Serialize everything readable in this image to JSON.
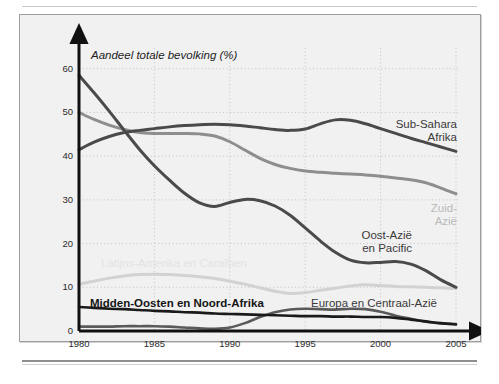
{
  "figure": {
    "top_cut_text": "",
    "background_color": "#f1f1f1",
    "border_color": "#9e9e9e"
  },
  "chart_data": {
    "type": "line",
    "title": "",
    "axis_title": "Aandeel totale bevolking (%)",
    "xlabel": "",
    "ylabel": "Aandeel totale bevolking (%)",
    "xlim": [
      1980,
      2005
    ],
    "ylim": [
      0,
      62
    ],
    "ytick_labels": [
      "0",
      "10",
      "20",
      "30",
      "40",
      "50",
      "60"
    ],
    "ytick_values": [
      0,
      10,
      20,
      30,
      40,
      50,
      60
    ],
    "xtick_labels": [
      "1980",
      "1985",
      "1990",
      "1995",
      "2000",
      "2005"
    ],
    "xtick_values": [
      1980,
      1985,
      1990,
      1995,
      2000,
      2005
    ],
    "grid": true,
    "legend": "inline-labels",
    "x": [
      1980,
      1981,
      1982,
      1983,
      1984,
      1985,
      1986,
      1987,
      1988,
      1989,
      1990,
      1991,
      1992,
      1993,
      1994,
      1995,
      1996,
      1997,
      1998,
      1999,
      2000,
      2001,
      2002,
      2003,
      2004,
      2005
    ],
    "series": [
      {
        "name": "Sub-Sahara Afrika",
        "label": "Sub-Sahara\nAfrika",
        "color": "#4a4a4a",
        "width": 3.0,
        "values": [
          41.5,
          43.2,
          44.5,
          45.4,
          45.9,
          46.3,
          46.7,
          47.0,
          47.2,
          47.3,
          47.2,
          46.9,
          46.5,
          46.1,
          45.9,
          46.2,
          47.4,
          48.3,
          48.2,
          47.4,
          46.3,
          45.2,
          44.1,
          43.1,
          42.1,
          41.1
        ]
      },
      {
        "name": "Zuid-Azië",
        "label": "Zuid-\nAzië",
        "color": "#8e8e8e",
        "width": 3.0,
        "values": [
          50.0,
          48.4,
          47.1,
          46.1,
          45.4,
          45.2,
          45.2,
          45.2,
          45.1,
          44.6,
          43.3,
          41.4,
          39.5,
          38.1,
          37.2,
          36.6,
          36.3,
          36.1,
          35.9,
          35.7,
          35.4,
          35.0,
          34.6,
          33.9,
          32.7,
          31.4
        ]
      },
      {
        "name": "Oost-Azië en Pacific",
        "label": "Oost-Azië\nen Pacific",
        "color": "#4a4a4a",
        "width": 3.0,
        "values": [
          58.5,
          54.5,
          50.3,
          45.9,
          41.6,
          37.8,
          34.5,
          31.5,
          29.3,
          28.5,
          29.4,
          30.1,
          29.8,
          28.6,
          26.5,
          23.6,
          20.6,
          18.0,
          16.2,
          15.6,
          15.7,
          15.9,
          15.3,
          13.8,
          11.7,
          10.0
        ]
      },
      {
        "name": "Latijns-Amerika en Caraïben",
        "label": "Latijns-Amerika en Caraïben",
        "color": "#d2d2d2",
        "width": 3.0,
        "values": [
          10.7,
          11.4,
          12.1,
          12.6,
          12.9,
          13.0,
          12.9,
          12.7,
          12.4,
          12.0,
          11.4,
          10.7,
          9.9,
          9.1,
          8.6,
          8.8,
          9.3,
          9.8,
          10.3,
          10.6,
          10.4,
          10.2,
          10.1,
          10.0,
          9.9,
          9.7
        ]
      },
      {
        "name": "Midden-Oosten en Noord-Afrika",
        "label": "Midden-Oosten en Noord-Afrika",
        "color": "#1a1a1a",
        "width": 2.6,
        "values": [
          5.5,
          5.3,
          5.1,
          5.0,
          4.8,
          4.6,
          4.5,
          4.3,
          4.2,
          4.0,
          3.9,
          3.8,
          3.7,
          3.6,
          3.5,
          3.4,
          3.4,
          3.3,
          3.3,
          3.2,
          3.2,
          3.0,
          2.6,
          2.2,
          1.8,
          1.5
        ]
      },
      {
        "name": "Europa en Centraal-Azië",
        "label": "Europa en Centraal-Azië",
        "color": "#5a5a5a",
        "width": 2.6,
        "values": [
          1.0,
          1.0,
          1.0,
          1.1,
          1.1,
          1.1,
          1.0,
          0.8,
          0.6,
          0.5,
          0.8,
          1.8,
          3.2,
          4.3,
          4.9,
          5.1,
          5.0,
          4.9,
          5.1,
          5.0,
          4.4,
          3.5,
          2.8,
          2.1,
          1.7,
          1.6
        ]
      }
    ]
  },
  "labels": {
    "subsahara_line1": "Sub-Sahara",
    "subsahara_line2": "Afrika",
    "zuidazie_line1": "Zuid-",
    "zuidazie_line2": "Azië",
    "oostazie_line1": "Oost-Azië",
    "oostazie_line2": "en Pacific",
    "latijns": "Latijns-Amerika en Caraïben",
    "midden": "Midden-Oosten en Noord-Afrika",
    "europa": "Europa en Centraal-Azië"
  }
}
